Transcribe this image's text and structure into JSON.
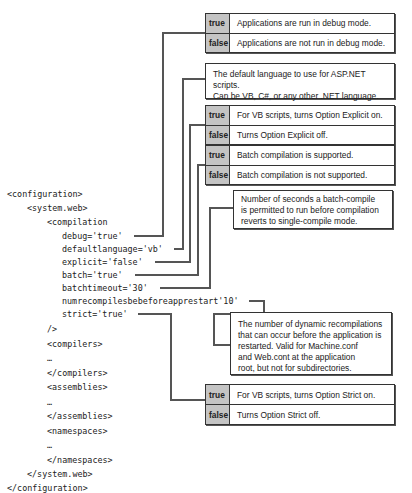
{
  "code": {
    "lines": [
      {
        "indent": 0,
        "text": "<configuration>"
      },
      {
        "indent": 1,
        "text": "<system.web>"
      },
      {
        "indent": 2,
        "text": "<compilation"
      },
      {
        "indent": 3,
        "text": "debug='true'"
      },
      {
        "indent": 3,
        "text": "defaultlanguage='vb'"
      },
      {
        "indent": 3,
        "text": "explicit='false'"
      },
      {
        "indent": 3,
        "text": "batch='true'"
      },
      {
        "indent": 3,
        "text": "batchtimeout='30'"
      },
      {
        "indent": 3,
        "text": "numrecompilesbebeforeapprestart'10'"
      },
      {
        "indent": 3,
        "text": "strict='true'"
      },
      {
        "indent": 2,
        "text": "/>"
      },
      {
        "indent": 2,
        "text": "<compilers>"
      },
      {
        "indent": 2,
        "text": "…"
      },
      {
        "indent": 2,
        "text": "</compilers>"
      },
      {
        "indent": 2,
        "text": "<assemblies>"
      },
      {
        "indent": 2,
        "text": "…"
      },
      {
        "indent": 2,
        "text": "</assemblies>"
      },
      {
        "indent": 2,
        "text": "<namespaces>"
      },
      {
        "indent": 2,
        "text": "…"
      },
      {
        "indent": 2,
        "text": "</namespaces>"
      },
      {
        "indent": 1,
        "text": "</system.web>"
      },
      {
        "indent": 0,
        "text": "</configuration>"
      }
    ]
  },
  "callouts": {
    "debug": {
      "true_key": "true",
      "true_desc": "Applications are run in debug mode.",
      "false_key": "false",
      "false_desc": "Applications are not run in debug mode."
    },
    "defaultlanguage": {
      "line1": "The default language to use for ASP.NET scripts.",
      "line2": "Can be VB, C#, or any other .NET language."
    },
    "explicit": {
      "true_key": "true",
      "true_desc": "For VB scripts, turns Option Explicit on.",
      "false_key": "false",
      "false_desc": "Turns Option Explicit off."
    },
    "batch": {
      "true_key": "true",
      "true_desc": "Batch compilation is supported.",
      "false_key": "false",
      "false_desc": "Batch compilation is not supported."
    },
    "batchtimeout": {
      "line1": "Number of seconds a batch-compile",
      "line2": "is permitted to run before compilation",
      "line3": "reverts to single-compile mode."
    },
    "numrecompiles": {
      "line1": "The number of dynamic recompilations",
      "line2": "that can occur before the application is",
      "line3": "restarted.  Valid for Machine.conf",
      "line4": "and Web.cont at the application",
      "line5": "root, but not for subdirectories."
    },
    "strict": {
      "true_key": "true",
      "true_desc": "For VB scripts, turns Option Strict on.",
      "false_key": "false",
      "false_desc": "Turns Option Strict off."
    }
  },
  "colors": {
    "key_cell": "#c4c4c4",
    "border": "#333333",
    "connector": "#555555",
    "text": "#222222"
  }
}
